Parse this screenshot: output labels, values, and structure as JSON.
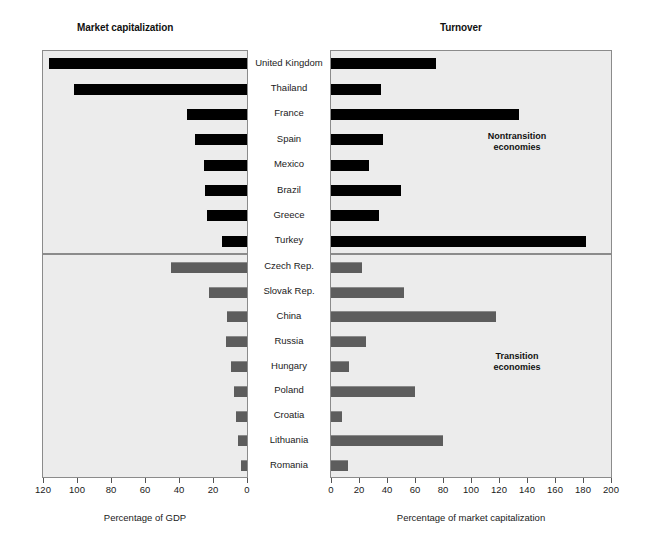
{
  "chart_data": {
    "type": "bar",
    "title": "",
    "orientation": "horizontal",
    "layout": "two-panel mirrored (left axis reversed), split into two country groups",
    "panels": [
      {
        "name": "market-capitalization",
        "title": "Market capitalization",
        "xlabel": "Percentage of GDP",
        "xlim": [
          120,
          0
        ],
        "reversed": true,
        "ticks": [
          120,
          100,
          80,
          60,
          40,
          20,
          0
        ],
        "grid": false
      },
      {
        "name": "turnover",
        "title": "Turnover",
        "xlabel": "Percentage of market capitalization",
        "xlim": [
          0,
          200
        ],
        "reversed": false,
        "ticks": [
          0,
          20,
          40,
          60,
          80,
          100,
          120,
          140,
          160,
          180,
          200
        ],
        "grid": false
      }
    ],
    "groups": [
      {
        "name": "nontransition",
        "annotation": "Nontransition\neconomies",
        "annotation_line1": "Nontransition",
        "annotation_line2": "economies",
        "bar_color": "#000000",
        "categories": [
          "United Kingdom",
          "Thailand",
          "France",
          "Spain",
          "Mexico",
          "Brazil",
          "Greece",
          "Turkey"
        ],
        "series": [
          {
            "name": "Market capitalization",
            "panel": "market-capitalization",
            "values": [
              116,
              101,
              35,
              30,
              25,
              24,
              23,
              14
            ]
          },
          {
            "name": "Turnover",
            "panel": "turnover",
            "values": [
              75,
              36,
              134,
              37,
              27,
              50,
              34,
              182
            ]
          }
        ]
      },
      {
        "name": "transition",
        "annotation": "Transition\neconomies",
        "annotation_line1": "Transition",
        "annotation_line2": "economies",
        "bar_color": "#5d5d5d",
        "categories": [
          "Czech Rep.",
          "Slovak Rep.",
          "China",
          "Russia",
          "Hungary",
          "Poland",
          "Croatia",
          "Lithuania",
          "Romania"
        ],
        "series": [
          {
            "name": "Market capitalization",
            "panel": "market-capitalization",
            "values": [
              44,
              22,
              11,
              12,
              9,
              7,
              6,
              5,
              3
            ]
          },
          {
            "name": "Turnover",
            "panel": "turnover",
            "values": [
              22,
              52,
              118,
              25,
              13,
              60,
              8,
              80,
              12
            ]
          }
        ]
      }
    ]
  },
  "axes": {
    "left": {
      "labels": [
        "120",
        "100",
        "80",
        "60",
        "40",
        "20",
        "0"
      ],
      "title": "Percentage of GDP"
    },
    "right": {
      "labels": [
        "0",
        "20",
        "40",
        "60",
        "80",
        "100",
        "120",
        "140",
        "160",
        "180",
        "200"
      ],
      "title": "Percentage of market capitalization"
    }
  },
  "colors": {
    "panel_background": "#ececec",
    "panel_border": "#8b8b8b",
    "bar_nontransition": "#000000",
    "bar_transition": "#5d5d5d",
    "page_background": "#ffffff",
    "text": "#1a1a1a"
  }
}
